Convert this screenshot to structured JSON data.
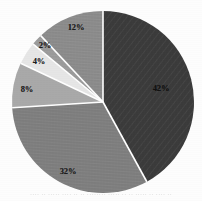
{
  "figure": {
    "background_color": "#fdfdfd",
    "separator_color": "#ffffff",
    "bottom_caption": "···· ·· ····· ···· ·· ·· ········ ····· ·· ·· ····· ·· ···· ··"
  },
  "chart_data": {
    "type": "pie",
    "title": "",
    "subtitle": "",
    "xlabel": "",
    "ylabel": "",
    "grid": false,
    "legend_position": "none",
    "data_labels": true,
    "label_format": "percent",
    "start_angle_deg": 0,
    "direction": "clockwise",
    "center": {
      "x": 103,
      "y": 102
    },
    "radius": 91,
    "total": 100,
    "categories": [
      "42%",
      "32%",
      "8%",
      "4%",
      "2%",
      "12%"
    ],
    "values": [
      42,
      32,
      8,
      4,
      2,
      12
    ],
    "labels": [
      "42%",
      "32%",
      "8%",
      "4%",
      "2%",
      "12%"
    ],
    "colors": [
      "#3a3a3a",
      "#7d7d7d",
      "#a9a9a9",
      "#e6e6e6",
      "#9a9a9a",
      "#8a8a8a"
    ],
    "slices": [
      {
        "label": "42%",
        "value": 42,
        "color": "#3a3a3a",
        "texture": "diagonal-hatch",
        "label_x": 161,
        "label_y": 88,
        "label_on_dark": true
      },
      {
        "label": "32%",
        "value": 32,
        "color": "#7d7d7d",
        "texture": "horizontal-hatch",
        "label_x": 68,
        "label_y": 171,
        "label_on_dark": false
      },
      {
        "label": "8%",
        "value": 8,
        "color": "#a9a9a9",
        "texture": "plain",
        "label_x": 27,
        "label_y": 89,
        "label_on_dark": false
      },
      {
        "label": "4%",
        "value": 4,
        "color": "#e6e6e6",
        "texture": "plain",
        "label_x": 39,
        "label_y": 61,
        "label_on_dark": false
      },
      {
        "label": "2%",
        "value": 2,
        "color": "#9a9a9a",
        "texture": "horizontal-hatch",
        "label_x": 45,
        "label_y": 45,
        "label_on_dark": false
      },
      {
        "label": "12%",
        "value": 12,
        "color": "#8a8a8a",
        "texture": "horizontal-hatch",
        "label_x": 76,
        "label_y": 27,
        "label_on_dark": false
      }
    ]
  }
}
